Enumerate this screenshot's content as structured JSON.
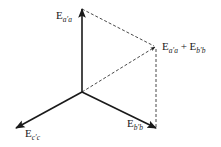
{
  "diagram": {
    "colors": {
      "stroke": "#1a1a1a",
      "background": "#ffffff"
    },
    "origin": {
      "x": 82,
      "y": 92
    },
    "vectors": [
      {
        "id": "E_aa",
        "label_main": "E",
        "label_sub": "a′a",
        "from": [
          82,
          92
        ],
        "to": [
          82,
          9
        ],
        "style": "solid"
      },
      {
        "id": "E_bb",
        "label_main": "E",
        "label_sub": "b′b",
        "from": [
          82,
          92
        ],
        "to": [
          156,
          128
        ],
        "style": "solid"
      },
      {
        "id": "E_cc",
        "label_main": "E",
        "label_sub": "c′c",
        "from": [
          82,
          92
        ],
        "to": [
          16,
          128
        ],
        "style": "solid"
      },
      {
        "id": "E_sum",
        "label": "E_a'a + E_b'b",
        "from": [
          82,
          92
        ],
        "to": [
          155,
          47
        ],
        "style": "dashed"
      }
    ],
    "construction_lines": [
      {
        "from": [
          82,
          9
        ],
        "to": [
          155,
          47
        ],
        "style": "dashed"
      },
      {
        "from": [
          155,
          47
        ],
        "to": [
          156,
          128
        ],
        "style": "dashed"
      }
    ],
    "labels": {
      "e_aa": {
        "main": "E",
        "sub": "a′a"
      },
      "e_bb": {
        "main": "E",
        "sub": "b′b"
      },
      "e_cc": {
        "main": "E",
        "sub": "c′c"
      },
      "sum": {
        "main1": "E",
        "sub1": "a′a",
        "plus": " + ",
        "main2": "E",
        "sub2": "b′b"
      }
    }
  }
}
